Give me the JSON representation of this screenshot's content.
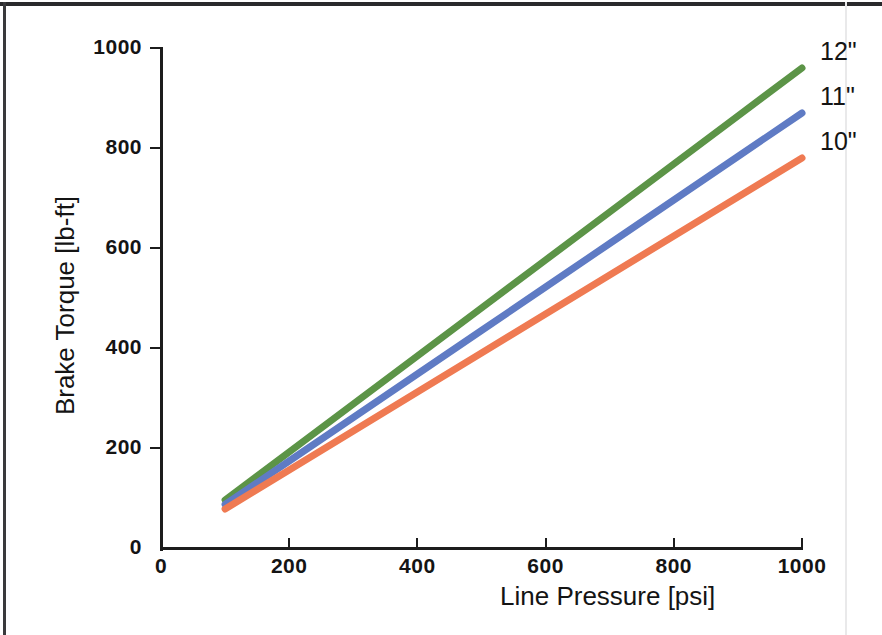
{
  "figure": {
    "background_color": "#ffffff",
    "frame_color": "#2a2a2c",
    "axis_color": "#1c1c1c"
  },
  "chart_data": {
    "type": "line",
    "title": "",
    "xlabel": "Line Pressure [psi]",
    "ylabel": "Brake Torque [lb-ft]",
    "xlim": [
      0,
      1000
    ],
    "ylim": [
      0,
      1000
    ],
    "xticks": [
      0,
      200,
      400,
      600,
      800,
      1000
    ],
    "yticks": [
      0,
      200,
      400,
      600,
      800,
      1000
    ],
    "xtick_labels": [
      "0",
      "200",
      "400",
      "600",
      "800",
      "1000"
    ],
    "ytick_labels": [
      "0",
      "200",
      "400",
      "600",
      "800",
      "1000"
    ],
    "grid": false,
    "legend_position": "right-of-line-ends",
    "x": [
      100,
      200,
      300,
      400,
      500,
      600,
      700,
      800,
      900,
      1000
    ],
    "series": [
      {
        "name": "12\"",
        "label": "12\"",
        "color": "#5c9447",
        "values": [
          96,
          192,
          288,
          384,
          480,
          576,
          672,
          768,
          864,
          960
        ]
      },
      {
        "name": "11\"",
        "label": "11\"",
        "color": "#5f7bc4",
        "values": [
          87,
          174,
          261,
          348,
          435,
          522,
          609,
          696,
          783,
          870
        ]
      },
      {
        "name": "10\"",
        "label": "10\"",
        "color": "#ef7a52",
        "values": [
          78,
          156,
          234,
          312,
          390,
          468,
          546,
          624,
          702,
          780
        ]
      }
    ]
  },
  "annotations": {
    "series_label_12": "12\"",
    "series_label_11": "11\"",
    "series_label_10": "10\""
  }
}
